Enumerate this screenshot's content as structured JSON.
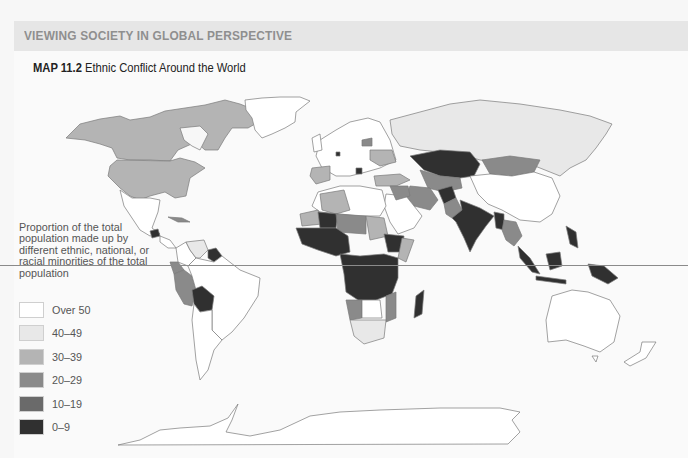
{
  "header": {
    "section_title": "VIEWING SOCIETY IN GLOBAL PERSPECTIVE"
  },
  "map": {
    "number": "MAP 11.2",
    "title": "Ethnic Conflict Around the World"
  },
  "legend": {
    "title": "Proportion of the total population made up by different ethnic, national, or racial minorities of the total population",
    "title_lines": [
      "Proportion of the",
      "total population",
      "made up by different",
      "ethnic, national, or",
      "racial minorities",
      "of the total population"
    ],
    "items": [
      {
        "label": "Over 50",
        "color": "#ffffff"
      },
      {
        "label": "40–49",
        "color": "#e8e8e8"
      },
      {
        "label": "30–39",
        "color": "#b4b4b4"
      },
      {
        "label": "20–29",
        "color": "#8a8a8a"
      },
      {
        "label": "10–19",
        "color": "#6a6a6a"
      },
      {
        "label": "0–9",
        "color": "#303030"
      }
    ]
  },
  "colors": {
    "background": "#f7f7f7",
    "header_band": "#e6e6e6",
    "header_text": "#8f8f8f",
    "border": "#7a7a7a",
    "equator": "#8a8a8a"
  }
}
